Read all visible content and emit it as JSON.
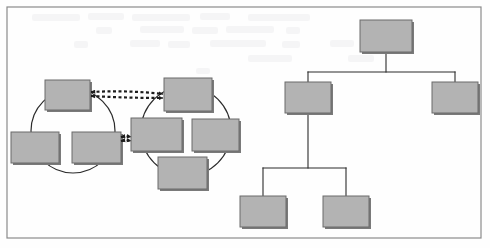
{
  "figure": {
    "kind": "scanned-diagram",
    "width": 490,
    "height": 248,
    "background_color": "#fefefe",
    "frame": {
      "name": "figure-border",
      "x": 7,
      "y": 7,
      "width": 474,
      "height": 231,
      "stroke_color": "#8a8a8a",
      "stroke_width": 1.2
    },
    "scan_artifact_text": "",
    "node_style": {
      "fill_color": "#b3b3b3",
      "stroke_color": "#6b6b6b",
      "stroke_width": 1,
      "shadow_color": "#7a7a7a",
      "shadow_offset_x": 2,
      "shadow_offset_y": 2
    },
    "connector_style": {
      "solid_color": "#2b2b2b",
      "solid_width": 1.1,
      "circle_color": "#2b2b2b",
      "circle_width": 1.2,
      "dashed_color": "#1c1c1c",
      "dashed_width": 2.2,
      "dash_pattern": "3 2.5"
    }
  },
  "panels": [
    {
      "id": "left-panel",
      "label": "cyclic-cluster-panel",
      "clusters": [
        {
          "id": "cluster-a",
          "label": "left-ring-cluster",
          "ring": {
            "cx": 73,
            "cy": 131,
            "r": 42
          },
          "nodes": [
            {
              "id": "a1",
              "label": "cluster-a-node-top",
              "x": 45,
              "y": 80,
              "w": 45,
              "h": 30
            },
            {
              "id": "a2",
              "label": "cluster-a-node-bottom-left",
              "x": 11,
              "y": 132,
              "w": 48,
              "h": 31
            },
            {
              "id": "a3",
              "label": "cluster-a-node-bottom-right",
              "x": 72,
              "y": 132,
              "w": 49,
              "h": 31
            }
          ]
        },
        {
          "id": "cluster-b",
          "label": "right-ring-cluster",
          "ring": {
            "cx": 186,
            "cy": 131,
            "r": 45
          },
          "nodes": [
            {
              "id": "b1",
              "label": "cluster-b-node-top",
              "x": 164,
              "y": 78,
              "w": 48,
              "h": 33
            },
            {
              "id": "b2",
              "label": "cluster-b-node-left",
              "x": 131,
              "y": 118,
              "w": 51,
              "h": 33
            },
            {
              "id": "b3",
              "label": "cluster-b-node-right",
              "x": 192,
              "y": 119,
              "w": 47,
              "h": 32
            },
            {
              "id": "b4",
              "label": "cluster-b-node-bottom",
              "x": 158,
              "y": 157,
              "w": 49,
              "h": 32
            }
          ]
        }
      ],
      "links": [
        {
          "id": "link-top",
          "label": "bidirectional-dashed-link-top",
          "from": "a1",
          "to": "b1",
          "x1": 91,
          "y1": 93,
          "x2": 163,
          "y2": 95,
          "bow": 4,
          "arrows": "both"
        },
        {
          "id": "link-mid",
          "label": "bidirectional-dashed-link-middle",
          "from": "a3",
          "to": "b2",
          "x1": 121,
          "y1": 138,
          "x2": 131,
          "y2": 138,
          "bow": 2,
          "arrows": "both"
        }
      ]
    },
    {
      "id": "right-panel",
      "label": "hierarchy-tree-panel",
      "tree": {
        "nodes": [
          {
            "id": "t-root",
            "label": "tree-root-node",
            "x": 360,
            "y": 20,
            "w": 52,
            "h": 32,
            "level": 0
          },
          {
            "id": "t-l1a",
            "label": "tree-level1-left-node",
            "x": 285,
            "y": 82,
            "w": 46,
            "h": 31,
            "level": 1
          },
          {
            "id": "t-l1b",
            "label": "tree-level1-right-node",
            "x": 432,
            "y": 82,
            "w": 46,
            "h": 31,
            "level": 1
          },
          {
            "id": "t-l2a",
            "label": "tree-level2-left-node",
            "x": 240,
            "y": 196,
            "w": 46,
            "h": 31,
            "level": 2
          },
          {
            "id": "t-l2b",
            "label": "tree-level2-right-node",
            "x": 323,
            "y": 196,
            "w": 46,
            "h": 31,
            "level": 2
          }
        ],
        "edges": [
          {
            "id": "e-root-l1a",
            "label": "edge-root-to-left",
            "from": "t-root",
            "to": "t-l1a",
            "bus_y": 72
          },
          {
            "id": "e-root-l1b",
            "label": "edge-root-to-right",
            "from": "t-root",
            "to": "t-l1b",
            "bus_y": 72
          },
          {
            "id": "e-l1a-l2a",
            "label": "edge-left-to-child-left",
            "from": "t-l1a",
            "to": "t-l2a",
            "bus_y": 168
          },
          {
            "id": "e-l1a-l2b",
            "label": "edge-left-to-child-right",
            "from": "t-l1a",
            "to": "t-l2b",
            "bus_y": 168
          }
        ]
      }
    }
  ]
}
